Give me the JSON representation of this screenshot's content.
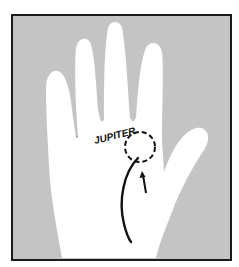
{
  "figure": {
    "background_color": "#ffffff",
    "frame_fill": "#c4c4c4",
    "frame_border": "#1a1a1a",
    "hand_fill": "#ffffff",
    "line_color": "#111111"
  },
  "labels": {
    "mount": "JUPITER"
  },
  "annotations": {
    "circle": "dashed circle marking mount of Jupiter",
    "arrow": "arrow pointing up to circle",
    "line": "curved line rising toward mount of Jupiter"
  }
}
